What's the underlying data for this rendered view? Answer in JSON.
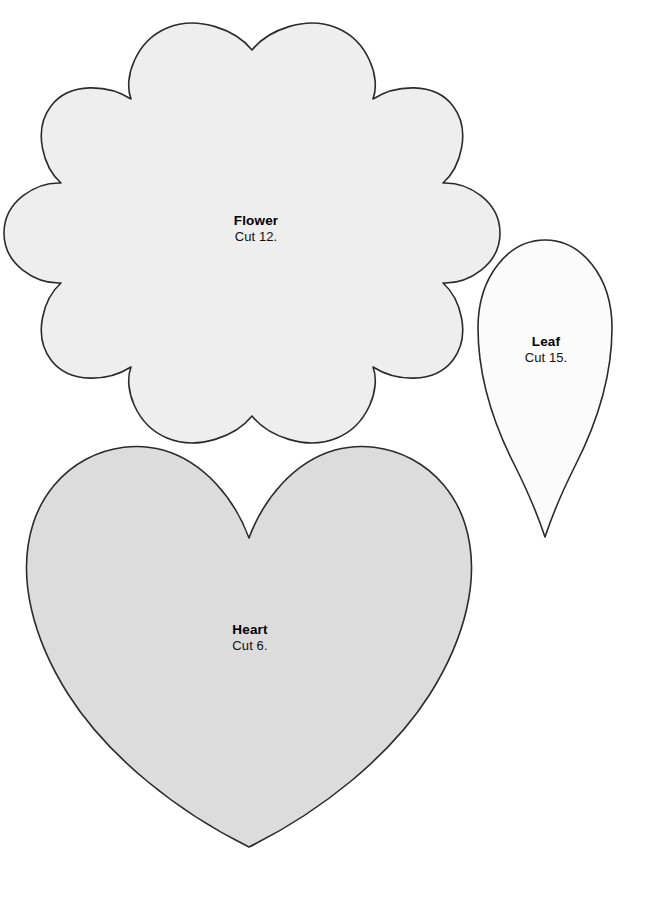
{
  "page": {
    "kind": "sewing-applique-template-sheet",
    "background_color": "#ffffff",
    "width": 653,
    "height": 905
  },
  "shapes": [
    {
      "id": "flower",
      "name": "Flower",
      "label_title": "Flower",
      "label_count": "Cut 12.",
      "fill": "#eeeeee",
      "stroke": "#2b2b2b",
      "petal_count": 8,
      "bounds": {
        "x": 56,
        "y": 28,
        "width": 392,
        "height": 410
      }
    },
    {
      "id": "leaf",
      "name": "Leaf",
      "label_title": "Leaf",
      "label_count": "Cut 15.",
      "fill": "#fbfbfb",
      "stroke": "#2b2b2b",
      "bounds": {
        "x": 478,
        "y": 240,
        "width": 134,
        "height": 297
      }
    },
    {
      "id": "heart",
      "name": "Heart",
      "label_title": "Heart",
      "label_count": "Cut 6.",
      "fill": "#dcdcdc",
      "stroke": "#2b2b2b",
      "bounds": {
        "x": 28,
        "y": 448,
        "width": 442,
        "height": 399
      }
    }
  ]
}
